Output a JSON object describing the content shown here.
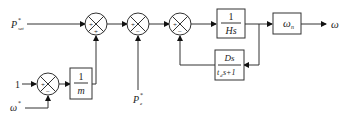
{
  "diagram": {
    "type": "control-block-diagram",
    "inputs": {
      "p_set": {
        "symbol": "P",
        "sup": "*",
        "sub": "set"
      },
      "one": "1",
      "omega_star": {
        "symbol": "ω",
        "sup": "*"
      },
      "pe_star": {
        "symbol": "P",
        "sup": "*",
        "sub": "e"
      }
    },
    "output": {
      "symbol": "ω"
    },
    "summing_junctions": [
      {
        "id": "sum1",
        "signs": [
          "+",
          "+"
        ]
      },
      {
        "id": "sum2",
        "signs": [
          "+",
          "−"
        ]
      },
      {
        "id": "sum3",
        "signs": [
          "+",
          "−"
        ]
      },
      {
        "id": "sum4",
        "signs": [
          "+",
          "−"
        ]
      }
    ],
    "blocks": {
      "inv_m": {
        "num": "1",
        "den": "m"
      },
      "inv_hs": {
        "num": "1",
        "den": "Hs"
      },
      "omega_n": {
        "symbol": "ω",
        "sub": "n"
      },
      "damping": {
        "num": "Ds",
        "den_a": "t",
        "den_sub": "d",
        "den_b": "s+1"
      }
    }
  }
}
